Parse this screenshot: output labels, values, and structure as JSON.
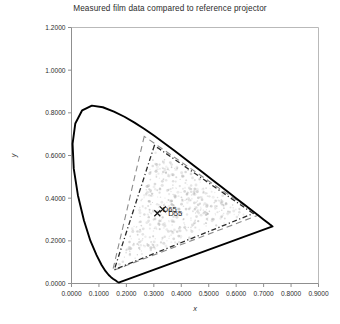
{
  "chart_data": {
    "type": "scatter",
    "title": "Measured film data compared to reference projector",
    "xlabel": "x",
    "ylabel": "y",
    "xlim": [
      0.0,
      0.9
    ],
    "ylim": [
      0.0,
      1.2
    ],
    "xticks": [
      "0.0000",
      "0.1000",
      "0.2000",
      "0.3000",
      "0.4000",
      "0.5000",
      "0.6000",
      "0.7000",
      "0.8000",
      "0.9000"
    ],
    "yticks": [
      "0.0000",
      "0.2000",
      "0.4000",
      "0.6000",
      "0.8000",
      "1.0000",
      "1.2000"
    ],
    "xtick_values": [
      0.0,
      0.1,
      0.2,
      0.3,
      0.4,
      0.5,
      0.6,
      0.7,
      0.8,
      0.9
    ],
    "ytick_values": [
      0.0,
      0.2,
      0.4,
      0.6,
      0.8,
      1.0,
      1.2
    ],
    "grid": false,
    "legend": "none",
    "annotations": [
      {
        "label": "D65",
        "x": 0.3127,
        "y": 0.329,
        "marker": "x"
      },
      {
        "label": "D55",
        "x": 0.3324,
        "y": 0.3474,
        "marker": "x"
      }
    ],
    "series": [
      {
        "name": "spectral-locus",
        "type": "closed-curve",
        "color": "#000000",
        "points": [
          [
            0.1741,
            0.005
          ],
          [
            0.174,
            0.005
          ],
          [
            0.1738,
            0.0049
          ],
          [
            0.1736,
            0.0049
          ],
          [
            0.1733,
            0.0048
          ],
          [
            0.173,
            0.0048
          ],
          [
            0.1726,
            0.0048
          ],
          [
            0.1721,
            0.0048
          ],
          [
            0.1714,
            0.0051
          ],
          [
            0.1703,
            0.0058
          ],
          [
            0.1689,
            0.0069
          ],
          [
            0.1669,
            0.0086
          ],
          [
            0.1644,
            0.0109
          ],
          [
            0.1611,
            0.0138
          ],
          [
            0.1566,
            0.0177
          ],
          [
            0.151,
            0.0227
          ],
          [
            0.144,
            0.0297
          ],
          [
            0.1355,
            0.0399
          ],
          [
            0.1241,
            0.0578
          ],
          [
            0.1096,
            0.0868
          ],
          [
            0.0913,
            0.1327
          ],
          [
            0.0687,
            0.2007
          ],
          [
            0.0454,
            0.295
          ],
          [
            0.0235,
            0.4127
          ],
          [
            0.0082,
            0.5384
          ],
          [
            0.0039,
            0.6548
          ],
          [
            0.0139,
            0.7502
          ],
          [
            0.0389,
            0.812
          ],
          [
            0.0743,
            0.8338
          ],
          [
            0.1142,
            0.8262
          ],
          [
            0.1547,
            0.8059
          ],
          [
            0.1929,
            0.7816
          ],
          [
            0.2296,
            0.7543
          ],
          [
            0.2658,
            0.7243
          ],
          [
            0.3016,
            0.6923
          ],
          [
            0.3373,
            0.6589
          ],
          [
            0.3731,
            0.6245
          ],
          [
            0.4087,
            0.5896
          ],
          [
            0.4441,
            0.5547
          ],
          [
            0.4788,
            0.5202
          ],
          [
            0.5125,
            0.4866
          ],
          [
            0.5448,
            0.4544
          ],
          [
            0.5752,
            0.4242
          ],
          [
            0.6029,
            0.3965
          ],
          [
            0.627,
            0.3725
          ],
          [
            0.6482,
            0.3514
          ],
          [
            0.6658,
            0.334
          ],
          [
            0.6801,
            0.3197
          ],
          [
            0.6915,
            0.3083
          ],
          [
            0.7006,
            0.2993
          ],
          [
            0.7079,
            0.292
          ],
          [
            0.714,
            0.2859
          ],
          [
            0.719,
            0.2809
          ],
          [
            0.723,
            0.277
          ],
          [
            0.726,
            0.274
          ],
          [
            0.7283,
            0.2717
          ],
          [
            0.73,
            0.27
          ],
          [
            0.7311,
            0.2689
          ],
          [
            0.732,
            0.268
          ],
          [
            0.7327,
            0.2673
          ]
        ]
      },
      {
        "name": "reference-projector-gamut",
        "type": "dashed-triangle",
        "style": "long-dash",
        "color": "#8c8c8c",
        "vertices": [
          [
            0.265,
            0.69
          ],
          [
            0.15,
            0.06
          ],
          [
            0.68,
            0.32
          ]
        ]
      },
      {
        "name": "measured-film-gamut",
        "type": "dashed-triangle",
        "style": "dash-dot",
        "color": "#2a2a2a",
        "vertices": [
          [
            0.302,
            0.647
          ],
          [
            0.156,
            0.065
          ],
          [
            0.662,
            0.328
          ]
        ]
      },
      {
        "name": "measured-film-samples",
        "type": "scatter-cloud",
        "color": "#b5b5b5",
        "marker": "dot",
        "n_points": 520
      }
    ]
  },
  "caption": {
    "text": " "
  }
}
